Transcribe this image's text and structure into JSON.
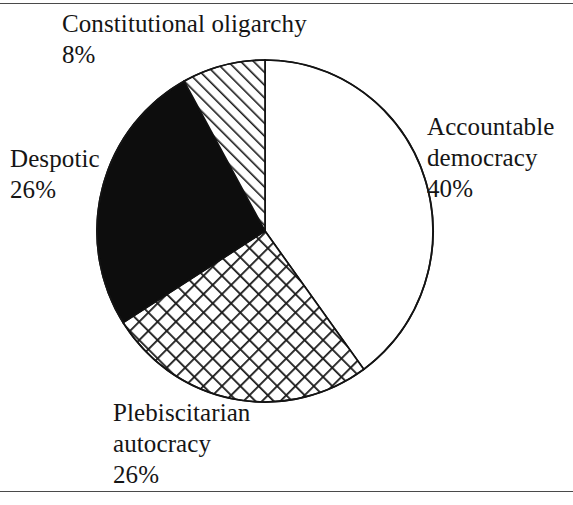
{
  "figure": {
    "has_top_rule": true,
    "has_bottom_rule": true,
    "rule_color": "#4a4a4a",
    "background": "#ffffff"
  },
  "chart_data": {
    "type": "pie",
    "title": "",
    "subtitle": "",
    "xlabel": "",
    "ylabel": "",
    "legend_position": "none",
    "grid": false,
    "start_angle_deg": 0,
    "direction": "clockwise",
    "center": {
      "x": 265,
      "y": 231
    },
    "radius": 170,
    "outline_color": "#111111",
    "categories": [
      "Accountable democracy",
      "Plebiscitarian autocracy",
      "Despotic",
      "Constitutional oligarchy"
    ],
    "values": [
      40,
      26,
      26,
      8
    ],
    "value_labels": [
      "40%",
      "26%",
      "26%",
      "8%"
    ],
    "units": "percent",
    "total": 100,
    "slices": [
      {
        "name": "Accountable democracy",
        "label_line1": "Accountable",
        "label_line2": "democracy",
        "value": 40,
        "value_label": "40%",
        "fill": "white",
        "fill_color": "#ffffff",
        "pattern": "none",
        "start_deg": 0,
        "end_deg": 144
      },
      {
        "name": "Plebiscitarian autocracy",
        "label_line1": "Plebiscitarian",
        "label_line2": "autocracy",
        "value": 26,
        "value_label": "26%",
        "fill": "crosshatch",
        "fill_color": "#ffffff",
        "pattern": "crosshatch-diagonal",
        "start_deg": 144,
        "end_deg": 237.6
      },
      {
        "name": "Despotic",
        "label_line1": "Despotic",
        "label_line2": "",
        "value": 26,
        "value_label": "26%",
        "fill": "solid-black",
        "fill_color": "#0d0d0d",
        "pattern": "none",
        "start_deg": 237.6,
        "end_deg": 331.2
      },
      {
        "name": "Constitutional oligarchy",
        "label_line1": "Constitutional oligarchy",
        "label_line2": "",
        "value": 8,
        "value_label": "8%",
        "fill": "hatch",
        "fill_color": "#ffffff",
        "pattern": "diagonal-hatch-45",
        "start_deg": 331.2,
        "end_deg": 360
      }
    ]
  },
  "labels": {
    "constitutional_oligarchy": {
      "name": "Constitutional oligarchy",
      "percent": "8%"
    },
    "accountable_democracy": {
      "line1": "Accountable",
      "line2": "democracy",
      "percent": "40%"
    },
    "despotic": {
      "name": "Despotic",
      "percent": "26%"
    },
    "plebiscitarian_autocracy": {
      "line1": "Plebiscitarian",
      "line2": "autocracy",
      "percent": "26%"
    }
  }
}
